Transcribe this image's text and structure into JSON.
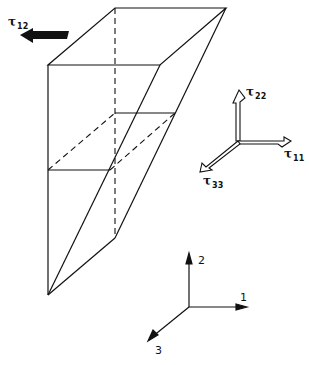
{
  "diagram": {
    "shear_label": {
      "symbol": "τ",
      "subscript": "12"
    },
    "stress_axes": {
      "tau22": {
        "symbol": "τ",
        "subscript": "22"
      },
      "tau11": {
        "symbol": "τ",
        "subscript": "11"
      },
      "tau33": {
        "symbol": "τ",
        "subscript": "33"
      }
    },
    "coord_axes": {
      "axis1": "1",
      "axis2": "2",
      "axis3": "3"
    },
    "colors": {
      "line": "#111111",
      "background": "#ffffff"
    }
  }
}
